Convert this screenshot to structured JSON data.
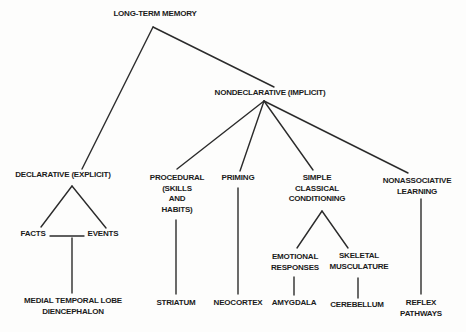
{
  "diagram": {
    "background_color": "#fdfdfc",
    "line_color": "#2b2b2b",
    "text_color": "#1b1b1b",
    "nodes": [
      {
        "id": "long-term-memory",
        "lines": [
          "LONG-TERM MEMORY"
        ],
        "cx": 155,
        "top": 9
      },
      {
        "id": "nondeclarative",
        "lines": [
          "NONDECLARATIVE (IMPLICIT)"
        ],
        "cx": 270,
        "top": 88
      },
      {
        "id": "declarative",
        "lines": [
          "DECLARATIVE (EXPLICIT)"
        ],
        "cx": 63,
        "top": 170
      },
      {
        "id": "procedural",
        "lines": [
          "PROCEDURAL",
          "(SKILLS",
          "AND",
          "HABITS)"
        ],
        "cx": 177,
        "top": 173
      },
      {
        "id": "priming",
        "lines": [
          "PRIMING"
        ],
        "cx": 238,
        "top": 173
      },
      {
        "id": "simple-classical-conditioning",
        "lines": [
          "SIMPLE",
          "CLASSICAL",
          "CONDITIONING"
        ],
        "cx": 317,
        "top": 173
      },
      {
        "id": "nonassociative-learning",
        "lines": [
          "NONASSOCIATIVE",
          "LEARNING"
        ],
        "cx": 417,
        "top": 176
      },
      {
        "id": "facts",
        "lines": [
          "FACTS"
        ],
        "cx": 33,
        "top": 229
      },
      {
        "id": "events",
        "lines": [
          "EVENTS"
        ],
        "cx": 103,
        "top": 229
      },
      {
        "id": "emotional-responses",
        "lines": [
          "EMOTIONAL",
          "RESPONSES"
        ],
        "cx": 295,
        "top": 252
      },
      {
        "id": "skeletal-musculature",
        "lines": [
          "SKELETAL",
          "MUSCULATURE"
        ],
        "cx": 359,
        "top": 251
      },
      {
        "id": "medial-temporal-lobe-diencephalon",
        "lines": [
          "MEDIAL TEMPORAL LOBE",
          "DIENCEPHALON"
        ],
        "cx": 73,
        "top": 296
      },
      {
        "id": "striatum",
        "lines": [
          "STRIATUM"
        ],
        "cx": 176,
        "top": 298
      },
      {
        "id": "neocortex",
        "lines": [
          "NEOCORTEX"
        ],
        "cx": 238,
        "top": 298
      },
      {
        "id": "amygdala",
        "lines": [
          "AMYGDALA"
        ],
        "cx": 294,
        "top": 298
      },
      {
        "id": "cerebellum",
        "lines": [
          "CEREBELLUM"
        ],
        "cx": 357,
        "top": 300
      },
      {
        "id": "reflex-pathways",
        "lines": [
          "REFLEX",
          "PATHWAYS"
        ],
        "cx": 421,
        "top": 298
      }
    ],
    "edges": [
      {
        "from": "long-term-memory",
        "to": "declarative",
        "x1": 153,
        "y1": 27,
        "x2": 82,
        "y2": 169
      },
      {
        "from": "long-term-memory",
        "to": "nondeclarative",
        "x1": 153,
        "y1": 27,
        "x2": 274,
        "y2": 87
      },
      {
        "from": "nondeclarative",
        "to": "procedural",
        "x1": 264,
        "y1": 101,
        "x2": 177,
        "y2": 169
      },
      {
        "from": "nondeclarative",
        "to": "priming",
        "x1": 264,
        "y1": 101,
        "x2": 240,
        "y2": 171
      },
      {
        "from": "nondeclarative",
        "to": "simple-classical-conditioning",
        "x1": 264,
        "y1": 101,
        "x2": 313,
        "y2": 170
      },
      {
        "from": "nondeclarative",
        "to": "nonassociative-learning",
        "x1": 264,
        "y1": 101,
        "x2": 408,
        "y2": 173
      },
      {
        "from": "declarative",
        "to": "facts",
        "x1": 72,
        "y1": 186,
        "x2": 41,
        "y2": 227
      },
      {
        "from": "declarative",
        "to": "events",
        "x1": 72,
        "y1": 186,
        "x2": 106,
        "y2": 228
      },
      {
        "from": "facts",
        "to": "events",
        "x1": 50,
        "y1": 236,
        "x2": 84,
        "y2": 236
      },
      {
        "from": "facts-events",
        "to": "medial-temporal-lobe-diencephalon",
        "x1": 72,
        "y1": 238,
        "x2": 72,
        "y2": 293
      },
      {
        "from": "procedural",
        "to": "striatum",
        "x1": 176,
        "y1": 220,
        "x2": 176,
        "y2": 294
      },
      {
        "from": "priming",
        "to": "neocortex",
        "x1": 238,
        "y1": 188,
        "x2": 238,
        "y2": 294
      },
      {
        "from": "simple-classical-conditioning",
        "to": "emotional-responses",
        "x1": 322,
        "y1": 211,
        "x2": 297,
        "y2": 248
      },
      {
        "from": "simple-classical-conditioning",
        "to": "skeletal-musculature",
        "x1": 322,
        "y1": 211,
        "x2": 348,
        "y2": 248
      },
      {
        "from": "emotional-responses",
        "to": "amygdala",
        "x1": 294,
        "y1": 277,
        "x2": 294,
        "y2": 295
      },
      {
        "from": "skeletal-musculature",
        "to": "cerebellum",
        "x1": 358,
        "y1": 278,
        "x2": 358,
        "y2": 298
      },
      {
        "from": "nonassociative-learning",
        "to": "reflex-pathways",
        "x1": 421,
        "y1": 199,
        "x2": 421,
        "y2": 294
      }
    ]
  }
}
